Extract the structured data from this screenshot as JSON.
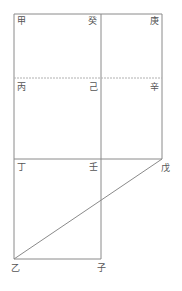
{
  "diagram": {
    "type": "geometric-figure",
    "colors": {
      "line": "#8a8a8a",
      "dashed": "#b0b0b0",
      "label": "#555555"
    },
    "labels": {
      "jia": "甲",
      "gui": "癸",
      "geng": "庚",
      "bing": "丙",
      "ji": "己",
      "xin": "辛",
      "ding": "丁",
      "ren": "壬",
      "wu": "戊",
      "yi": "乙",
      "zi": "子"
    }
  }
}
